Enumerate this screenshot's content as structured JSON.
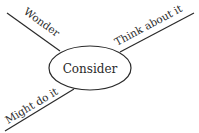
{
  "diagram": {
    "center": {
      "label": "Consider"
    },
    "branches": [
      {
        "label": "Wonder"
      },
      {
        "label": "Think about it"
      },
      {
        "label": "Might do it"
      }
    ]
  },
  "colors": {
    "line": "#2a2a2a",
    "background": "#ffffff"
  }
}
